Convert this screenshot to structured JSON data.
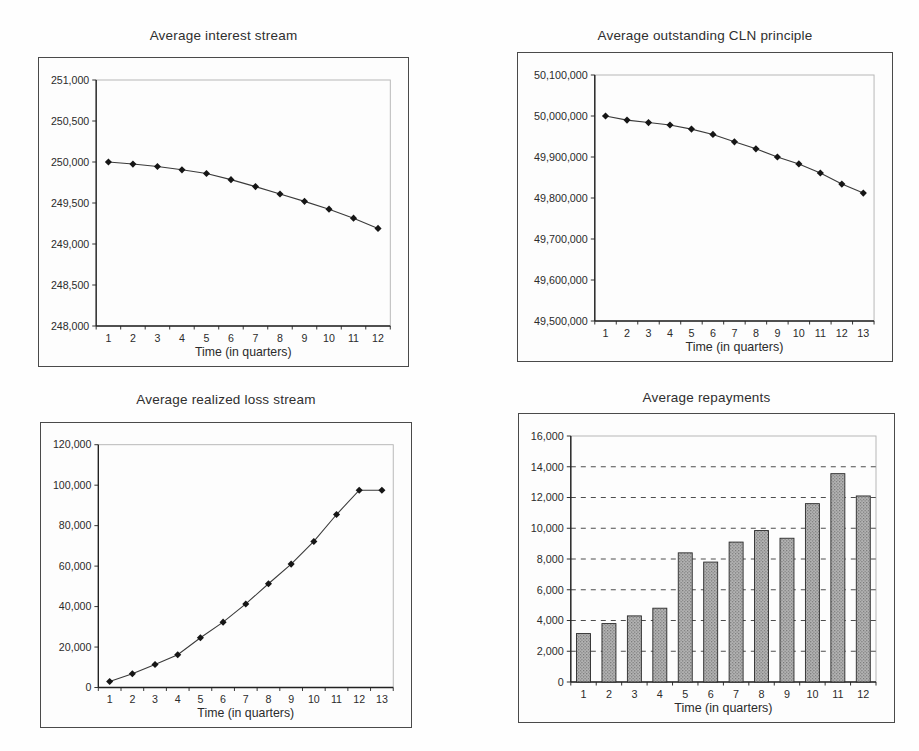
{
  "page": {
    "background_color": "#fefefe",
    "ink_color": "#2b2b2b"
  },
  "chart_data": [
    {
      "id": "average-interest-stream",
      "type": "line",
      "title": "Average interest stream",
      "xlabel": "Time (in quarters)",
      "categories": [
        "1",
        "2",
        "3",
        "4",
        "5",
        "6",
        "7",
        "8",
        "9",
        "10",
        "11",
        "12"
      ],
      "values": [
        250000,
        249975,
        249945,
        249905,
        249860,
        249785,
        249700,
        249610,
        249520,
        249425,
        249315,
        249190
      ],
      "ylim": [
        248000,
        251000
      ],
      "ytick_step": 500,
      "y_ticks": [
        "248,000",
        "248,500",
        "249,000",
        "249,500",
        "250,000",
        "250,500",
        "251,000"
      ],
      "grid": "none",
      "legend": "none",
      "marker": "diamond"
    },
    {
      "id": "average-outstanding-cln-principle",
      "type": "line",
      "title": "Average outstanding CLN principle",
      "xlabel": "Time (in quarters)",
      "categories": [
        "1",
        "2",
        "3",
        "4",
        "5",
        "6",
        "7",
        "8",
        "9",
        "10",
        "11",
        "12",
        "13"
      ],
      "values": [
        50000000,
        49990000,
        49984000,
        49978000,
        49968000,
        49955000,
        49937000,
        49920000,
        49900000,
        49883000,
        49861000,
        49834000,
        49812000
      ],
      "ylim": [
        49500000,
        50100000
      ],
      "ytick_step": 100000,
      "y_ticks": [
        "49,500,000",
        "49,600,000",
        "49,700,000",
        "49,800,000",
        "49,900,000",
        "50,000,000",
        "50,100,000"
      ],
      "grid": "none",
      "legend": "none",
      "marker": "diamond"
    },
    {
      "id": "average-realized-loss-stream",
      "type": "line",
      "title": "Average realized loss stream",
      "xlabel": "Time (in quarters)",
      "categories": [
        "1",
        "2",
        "3",
        "4",
        "5",
        "6",
        "7",
        "8",
        "9",
        "10",
        "11",
        "12",
        "13"
      ],
      "values": [
        3000,
        6800,
        11400,
        16200,
        24600,
        32300,
        41300,
        51300,
        61000,
        72200,
        85500,
        97500,
        97500
      ],
      "ylim": [
        0,
        120000
      ],
      "ytick_step": 20000,
      "y_ticks": [
        "0",
        "20,000",
        "40,000",
        "60,000",
        "80,000",
        "100,000",
        "120,000"
      ],
      "grid": "none",
      "legend": "none",
      "marker": "diamond"
    },
    {
      "id": "average-repayments",
      "type": "bar",
      "title": "Average repayments",
      "xlabel": "Time (in quarters)",
      "categories": [
        "1",
        "2",
        "3",
        "4",
        "5",
        "6",
        "7",
        "8",
        "9",
        "10",
        "11",
        "12"
      ],
      "values": [
        3150,
        3800,
        4300,
        4800,
        8400,
        7800,
        9100,
        9850,
        9350,
        11600,
        13550,
        12100
      ],
      "ylim": [
        0,
        16000
      ],
      "ytick_step": 2000,
      "y_ticks": [
        "0",
        "2,000",
        "4,000",
        "6,000",
        "8,000",
        "10,000",
        "12,000",
        "14,000",
        "16,000"
      ],
      "grid": "dashed-horizontal",
      "legend": "none",
      "bar_fill": "#b3b3b3",
      "bar_texture_dot": "#6f6f6f",
      "bar_outline": "#2a2a2a"
    }
  ]
}
